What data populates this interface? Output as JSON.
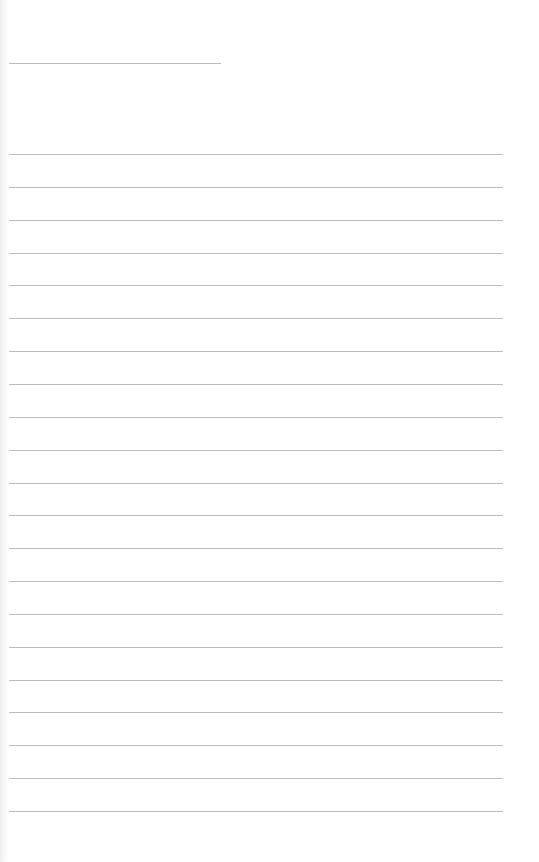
{
  "page": {
    "type": "blank lined sheet",
    "background_color": "#ffffff",
    "line_color": "#bdbdbd",
    "header_line": {
      "top": 63,
      "left": 9,
      "width": 212
    },
    "body_lines": {
      "count": 21,
      "first_top": 154,
      "spacing": 32.85,
      "left": 9,
      "width": 494
    }
  }
}
